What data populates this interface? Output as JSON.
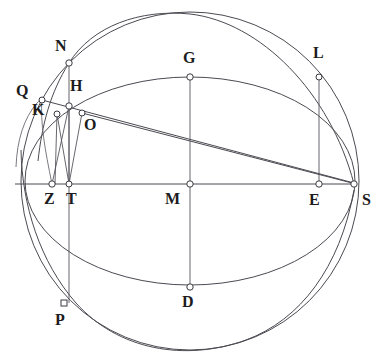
{
  "figure": {
    "background_color": "#ffffff",
    "stroke_color": "#4a4a52",
    "label_color": "#1b1b20",
    "width": 381,
    "height": 358
  },
  "points": [
    {
      "id": "N",
      "label": "N",
      "x": 69,
      "y": 63,
      "marker": "circle",
      "label_x": 55,
      "label_y": 38
    },
    {
      "id": "Q",
      "label": "Q",
      "x": 42,
      "y": 100,
      "marker": "circle",
      "label_x": 18,
      "label_y": 83
    },
    {
      "id": "H",
      "label": "H",
      "x": 69,
      "y": 106,
      "marker": "circle",
      "label_x": 69,
      "label_y": 79
    },
    {
      "id": "K",
      "label": "K",
      "x": 57,
      "y": 114,
      "marker": "circle",
      "label_x": 33,
      "label_y": 101
    },
    {
      "id": "O",
      "label": "O",
      "x": 82,
      "y": 113,
      "marker": "circle",
      "label_x": 83,
      "label_y": 116
    },
    {
      "id": "G",
      "label": "G",
      "x": 190,
      "y": 77,
      "marker": "circle",
      "label_x": 183,
      "label_y": 50
    },
    {
      "id": "L",
      "label": "L",
      "x": 319,
      "y": 77,
      "marker": "circle",
      "label_x": 313,
      "label_y": 45
    },
    {
      "id": "Z",
      "label": "Z",
      "x": 52,
      "y": 184,
      "marker": "circle",
      "label_x": 44,
      "label_y": 189
    },
    {
      "id": "T",
      "label": "T",
      "x": 69,
      "y": 184,
      "marker": "circle",
      "label_x": 67,
      "label_y": 189
    },
    {
      "id": "M",
      "label": "M",
      "x": 190,
      "y": 184,
      "marker": "circle",
      "label_x": 167,
      "label_y": 189
    },
    {
      "id": "E",
      "label": "E",
      "x": 319,
      "y": 184,
      "marker": "circle",
      "label_x": 309,
      "label_y": 190
    },
    {
      "id": "S",
      "label": "S",
      "x": 354,
      "y": 184,
      "marker": "circle",
      "label_x": 362,
      "label_y": 190
    },
    {
      "id": "D",
      "label": "D",
      "x": 190,
      "y": 287,
      "marker": "circle",
      "label_x": 182,
      "label_y": 292
    },
    {
      "id": "P",
      "label": "P",
      "x": 64,
      "y": 303,
      "marker": "square",
      "label_x": 54,
      "label_y": 310
    }
  ],
  "segments": [
    {
      "id": "horizon-diameter",
      "from": "left-rim",
      "to": "S"
    },
    {
      "id": "N-P-vertical",
      "from": "N",
      "to": "P"
    },
    {
      "id": "G-D-vertical",
      "from": "G",
      "to": "D"
    },
    {
      "id": "L-E-vertical",
      "from": "L",
      "to": "E"
    },
    {
      "id": "K-Z-vertical",
      "from": "K",
      "to": "Z"
    },
    {
      "id": "H-Z-line",
      "from": "H",
      "to": "Z"
    },
    {
      "id": "H-T-line",
      "from": "H",
      "to": "T"
    },
    {
      "id": "K-T-line",
      "from": "K",
      "to": "T"
    },
    {
      "id": "O-T-line",
      "from": "O",
      "to": "T"
    },
    {
      "id": "O-E-chord",
      "from": "O",
      "to": "E"
    },
    {
      "id": "H-S-chord",
      "from": "H",
      "to": "S"
    },
    {
      "id": "E-S-spoke",
      "from": "E",
      "to": "S"
    }
  ],
  "curves": [
    {
      "id": "outer-sphere-circle",
      "type": "circle",
      "cx": 190,
      "cy": 181,
      "r": 169
    },
    {
      "id": "equator-ellipse",
      "type": "ellipse",
      "cx": 190,
      "cy": 181,
      "rx": 165,
      "ry": 104
    },
    {
      "id": "horizon-great-circle",
      "type": "arc",
      "through": [
        "Q",
        "Z",
        "P"
      ]
    },
    {
      "id": "meridian-arc",
      "type": "arc",
      "through": [
        "N",
        "Q",
        "S"
      ]
    }
  ],
  "labels": {
    "N": "N",
    "Q": "Q",
    "H": "H",
    "K": "K",
    "O": "O",
    "G": "G",
    "L": "L",
    "Z": "Z",
    "T": "T",
    "M": "M",
    "E": "E",
    "S": "S",
    "D": "D",
    "P": "P"
  }
}
